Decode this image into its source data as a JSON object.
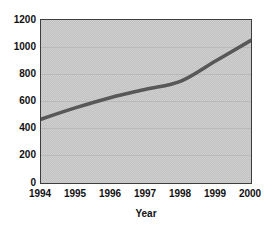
{
  "chart_data": {
    "type": "line",
    "title": "",
    "xlabel": "Year",
    "ylabel": "",
    "x": [
      1994,
      1995,
      1996,
      1997,
      1998,
      1999,
      2000
    ],
    "values": [
      470,
      555,
      630,
      690,
      750,
      900,
      1050
    ],
    "series_name": "",
    "ylim": [
      0,
      1200
    ],
    "yticks": [
      0,
      200,
      400,
      600,
      800,
      1000,
      1200
    ],
    "grid": true,
    "legend_position": "none",
    "smooth": true,
    "colors": {
      "line": "#585858",
      "plot_background": "#c9c9c9",
      "axis_border": "#3d3d3d",
      "gridline": "#b9b9b9",
      "text": "#111111",
      "figure_background": "#ffffff"
    }
  }
}
